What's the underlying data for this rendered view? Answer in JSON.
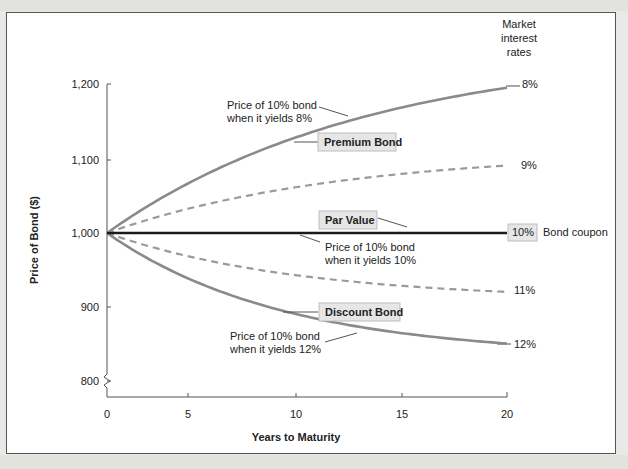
{
  "chart_data": {
    "type": "line",
    "title": "",
    "xlabel": "Years to Maturity",
    "ylabel": "Price of Bond ($)",
    "x_ticks": [
      "0",
      "5",
      "10",
      "15",
      "20"
    ],
    "y_ticks": [
      "800",
      "900",
      "1,000",
      "1,100",
      "1,200"
    ],
    "xlim": [
      0,
      20
    ],
    "ylim": [
      780,
      1200
    ],
    "grid": false,
    "legend_title": "Market interest rates",
    "coupon_rate": 0.1,
    "face_value": 1000,
    "x": [
      0,
      2,
      4,
      6,
      8,
      10,
      12,
      14,
      16,
      18,
      20
    ],
    "series": [
      {
        "name": "8%",
        "rate": 0.08,
        "style": "solid",
        "values": [
          1000,
          1035.67,
          1066.24,
          1092.46,
          1114.93,
          1134.2,
          1150.72,
          1164.88,
          1177.02,
          1187.44,
          1196.36
        ]
      },
      {
        "name": "9%",
        "rate": 0.09,
        "style": "dashed",
        "values": [
          1000,
          1017.59,
          1032.4,
          1044.86,
          1055.35,
          1064.18,
          1071.61,
          1077.86,
          1083.13,
          1087.56,
          1091.29
        ]
      },
      {
        "name": "10%",
        "rate": 0.1,
        "style": "solid-dark",
        "values": [
          1000,
          1000,
          1000,
          1000,
          1000,
          1000,
          1000,
          1000,
          1000,
          1000,
          1000
        ]
      },
      {
        "name": "11%",
        "rate": 0.11,
        "style": "dashed",
        "values": [
          1000,
          982.87,
          968.98,
          957.69,
          948.54,
          941.11,
          935.08,
          930.18,
          926.21,
          922.98,
          920.37
        ]
      },
      {
        "name": "12%",
        "rate": 0.12,
        "style": "solid",
        "values": [
          1000,
          966.2,
          939.25,
          917.77,
          900.65,
          887.0,
          876.12,
          867.44,
          860.53,
          855.02,
          850.61
        ]
      }
    ],
    "annotations": [
      {
        "text_lines": [
          "Price of 10% bond",
          "when it yields 8%"
        ]
      },
      {
        "text": "Premium Bond",
        "boxed": true
      },
      {
        "text": "Par Value",
        "boxed": true
      },
      {
        "text_lines": [
          "Price of 10% bond",
          "when it yields 10%"
        ]
      },
      {
        "text": "Discount Bond",
        "boxed": true
      },
      {
        "text_lines": [
          "Price of 10% bond",
          "when it yields 12%"
        ]
      },
      {
        "text": "Bond coupon"
      }
    ]
  },
  "labels": {
    "legend_title_lines": [
      "Market",
      "interest",
      "rates"
    ],
    "rate_8": "8%",
    "rate_9": "9%",
    "rate_10": "10%",
    "rate_11": "11%",
    "rate_12": "12%",
    "bond_coupon": "Bond coupon",
    "premium_bond": "Premium Bond",
    "par_value": "Par Value",
    "discount_bond": "Discount Bond",
    "ann8_l1": "Price of 10% bond",
    "ann8_l2": "when it yields 8%",
    "ann10_l1": "Price of 10% bond",
    "ann10_l2": "when it yields 10%",
    "ann12_l1": "Price of 10% bond",
    "ann12_l2": "when it yields 12%",
    "ytick_1200": "1,200",
    "ytick_1100": "1,100",
    "ytick_1000": "1,000",
    "ytick_900": "900",
    "ytick_800": "800",
    "xtick_0": "0",
    "xtick_5": "5",
    "xtick_10": "10",
    "xtick_15": "15",
    "xtick_20": "20",
    "xlabel": "Years to Maturity",
    "ylabel": "Price of Bond ($)"
  },
  "colors": {
    "curve_gray": "#8a8a8a",
    "par_line": "#1a1a1a",
    "box_fill": "#e6e6e6",
    "box_stroke": "#bdbdbd"
  }
}
